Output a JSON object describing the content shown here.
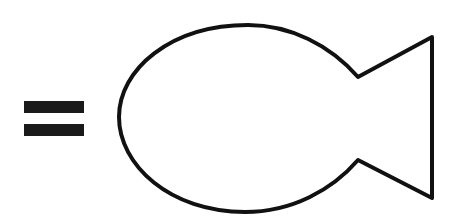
{
  "diagram": {
    "elements": [
      {
        "type": "equals-sign",
        "color": "#1a1a1a"
      },
      {
        "type": "fish-outline",
        "stroke": "#111111",
        "fill": "#ffffff"
      }
    ]
  },
  "colors": {
    "background": "#ffffff",
    "ink": "#1a1a1a"
  }
}
